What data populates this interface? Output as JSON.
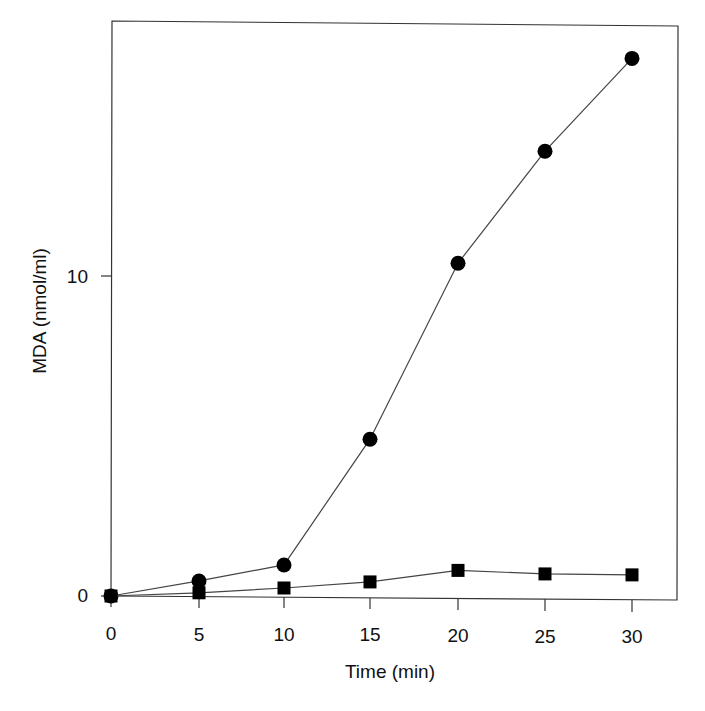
{
  "chart_data": {
    "type": "line",
    "title": "",
    "xlabel": "Time (min)",
    "ylabel": "MDA (nmol/ml)",
    "x": [
      0,
      5,
      10,
      15,
      20,
      25,
      30
    ],
    "xticks": [
      "0",
      "5",
      "10",
      "15",
      "20",
      "25",
      "30"
    ],
    "yticks": [
      "0",
      "10"
    ],
    "xlim": [
      -1,
      32.5
    ],
    "ylim": [
      0,
      18
    ],
    "grid": false,
    "legend": null,
    "series": [
      {
        "name": "circles",
        "marker": "circle",
        "color": "#000000",
        "values": [
          0,
          0.47,
          0.97,
          4.9,
          10.4,
          13.9,
          16.8
        ]
      },
      {
        "name": "squares",
        "marker": "square",
        "color": "#000000",
        "values": [
          0,
          0.1,
          0.25,
          0.44,
          0.8,
          0.69,
          0.66
        ]
      }
    ]
  },
  "axes": {
    "xlabel": "Time (min)",
    "ylabel": "MDA (nmol/ml)",
    "xticks": [
      "0",
      "5",
      "10",
      "15",
      "20",
      "25",
      "30"
    ],
    "yticks": [
      "0",
      "10"
    ]
  }
}
